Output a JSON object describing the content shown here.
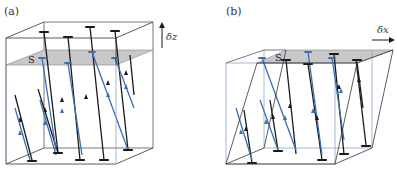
{
  "figure": {
    "panels": [
      {
        "label": "(a)",
        "displacement_label": "δz",
        "displacement_direction": "up",
        "plane_label": "S",
        "description": "Undeformed box with tilted flux lines (black and blue) crossing grey plane S; box displaced vertically by δz"
      },
      {
        "label": "(b)",
        "displacement_label": "δx",
        "displacement_direction": "right",
        "plane_label": "S",
        "description": "Sheared box (top displaced by δx) with flux lines crossing grey plane S"
      }
    ]
  },
  "colors": {
    "black_line": "#1a1a1a",
    "blue_line": "#3b6fb0",
    "plane_fill": "#c8c8c8",
    "box_edge_dark": "#333333",
    "box_edge_blue": "#8fa6c8"
  }
}
